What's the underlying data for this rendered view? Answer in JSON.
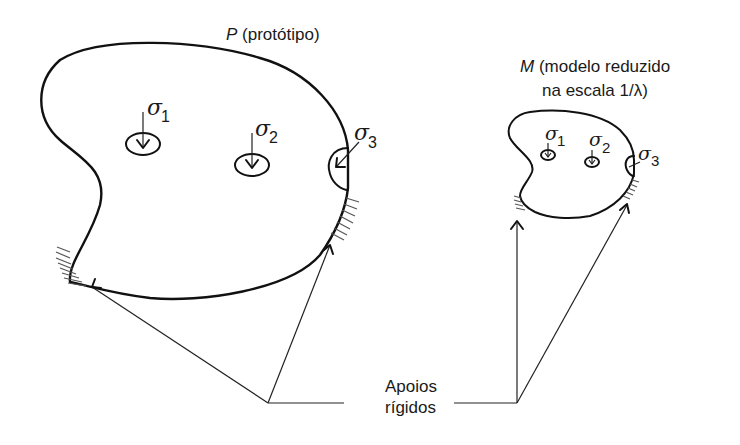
{
  "prototype": {
    "symbol": "P",
    "label": " (protótipo)",
    "stresses": [
      {
        "symbol": "σ",
        "sub": "1"
      },
      {
        "symbol": "σ",
        "sub": "2"
      },
      {
        "symbol": "σ",
        "sub": "3"
      }
    ]
  },
  "model": {
    "symbol": "M",
    "label_line1": " (modelo reduzido",
    "label_line2": "na escala 1/λ)",
    "stresses": [
      {
        "symbol": "σ",
        "sub": "1"
      },
      {
        "symbol": "σ",
        "sub": "2"
      },
      {
        "symbol": "σ",
        "sub": "3"
      }
    ]
  },
  "supports": {
    "line1": "Apoios",
    "line2": "rígidos"
  },
  "colors": {
    "stroke": "#111111",
    "background": "#ffffff"
  }
}
